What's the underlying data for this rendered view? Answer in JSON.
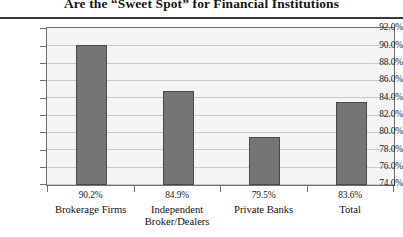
{
  "chart_data": {
    "type": "bar",
    "title": "Are the “Sweet Spot” for Financial Institutions",
    "xlabel": "",
    "ylabel": "",
    "ylim": [
      74.0,
      92.0
    ],
    "ytick_step": 2.0,
    "grid": true,
    "legend": "none",
    "categories": [
      "Brokerage Firms",
      "Independent Broker/Dealers",
      "Private Banks",
      "Total"
    ],
    "category_lines": [
      [
        "Brokerage Firms"
      ],
      [
        "Independent",
        "Broker/Dealers"
      ],
      [
        "Private Banks"
      ],
      [
        "Total"
      ]
    ],
    "values": [
      90.2,
      84.9,
      79.5,
      83.6
    ],
    "value_labels": [
      "90.2%",
      "84.9%",
      "79.5%",
      "83.6%"
    ],
    "ytick_labels": [
      "92.0%",
      "90.0%",
      "88.0%",
      "86.0%",
      "84.0%",
      "82.0%",
      "80.0%",
      "78.0%",
      "76.0%",
      "74.0%"
    ],
    "bar_color": "#757575",
    "bar_edge_color": "#4a4a4a",
    "plot_background": "#f4f4f4",
    "gridline_color": "#c9c9c9",
    "axis_color": "#6f6f6f"
  }
}
